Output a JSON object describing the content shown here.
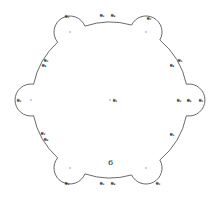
{
  "diagram": {
    "title": "",
    "stroke_color": "#444444",
    "center": {
      "x": 110,
      "y": 100,
      "label": "θ₁"
    },
    "main_circle_radius": 78,
    "number_label": {
      "text": "6",
      "x": 108,
      "y": 165
    },
    "lobes": [
      {
        "name": "top-left",
        "cx": 70,
        "cy": 32,
        "r": 16,
        "label": "θ₂",
        "lx": 67,
        "ly": 17
      },
      {
        "name": "top-right",
        "cx": 146,
        "cy": 32,
        "r": 16,
        "label": "θ₂",
        "lx": 149,
        "ly": 19
      },
      {
        "name": "left",
        "cx": 31,
        "cy": 100,
        "r": 16,
        "label": "θ₂",
        "lx": 19,
        "ly": 101
      },
      {
        "name": "right",
        "cx": 189,
        "cy": 100,
        "r": 16,
        "label": "θ₂",
        "lx": 201,
        "ly": 101
      },
      {
        "name": "bottom-left",
        "cx": 70,
        "cy": 168,
        "r": 16,
        "label": "θ₂",
        "lx": 67,
        "ly": 184
      },
      {
        "name": "bottom-right",
        "cx": 146,
        "cy": 168,
        "r": 16,
        "label": "θ₂",
        "lx": 158,
        "ly": 184
      }
    ],
    "edge_labels": [
      {
        "text": "θ₃",
        "x": 102,
        "y": 16
      },
      {
        "text": "θ₄",
        "x": 113,
        "y": 16
      },
      {
        "text": "θ₃",
        "x": 46,
        "y": 61
      },
      {
        "text": "θ₄",
        "x": 44,
        "y": 66
      },
      {
        "text": "θ₃",
        "x": 180,
        "y": 61
      },
      {
        "text": "θ₄",
        "x": 172,
        "y": 66
      },
      {
        "text": "θ₃",
        "x": 179,
        "y": 101
      },
      {
        "text": "θ₄",
        "x": 189,
        "y": 101
      },
      {
        "text": "θ₃",
        "x": 43,
        "y": 134
      },
      {
        "text": "θ₄",
        "x": 46,
        "y": 140
      },
      {
        "text": "θ₃",
        "x": 172,
        "y": 135
      },
      {
        "text": "θ₃",
        "x": 102,
        "y": 184
      },
      {
        "text": "θ₄",
        "x": 113,
        "y": 184
      }
    ]
  }
}
